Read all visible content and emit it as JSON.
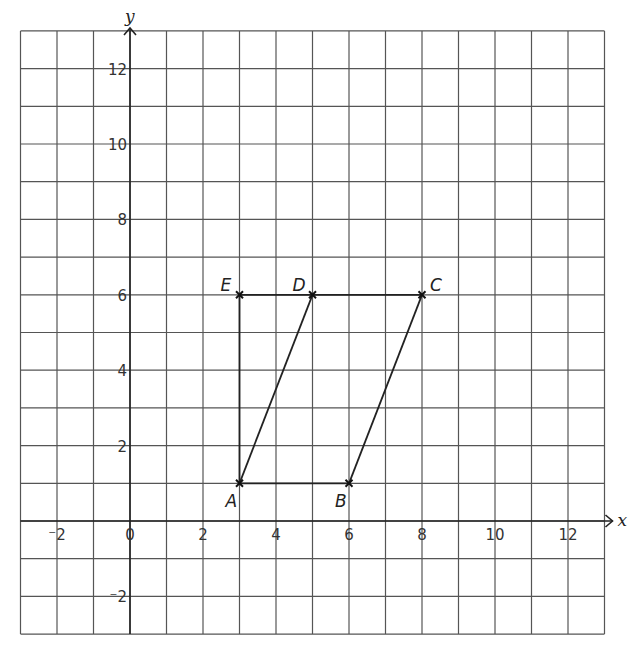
{
  "figure": {
    "type": "coordinate-grid",
    "x_axis": {
      "label": "x",
      "min": -3,
      "max": 13,
      "ticks": [
        -2,
        0,
        2,
        4,
        6,
        8,
        10,
        12
      ]
    },
    "y_axis": {
      "label": "y",
      "min": -3,
      "max": 13,
      "ticks": [
        -2,
        2,
        4,
        6,
        8,
        10,
        12
      ]
    },
    "origin_label": "0",
    "points": [
      {
        "name": "A",
        "x": 3,
        "y": 1
      },
      {
        "name": "B",
        "x": 6,
        "y": 1
      },
      {
        "name": "C",
        "x": 8,
        "y": 6
      },
      {
        "name": "D",
        "x": 5,
        "y": 6
      },
      {
        "name": "E",
        "x": 3,
        "y": 6
      }
    ],
    "segments": [
      [
        "A",
        "B"
      ],
      [
        "B",
        "C"
      ],
      [
        "C",
        "E"
      ],
      [
        "E",
        "A"
      ],
      [
        "A",
        "D"
      ]
    ],
    "colors": {
      "grid": "#555555",
      "ink": "#222222",
      "background": "#ffffff"
    }
  }
}
